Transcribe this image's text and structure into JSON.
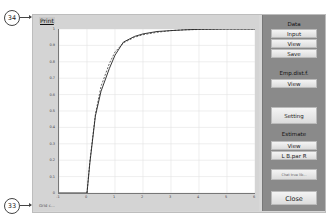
{
  "callouts": [
    {
      "label": "34",
      "target": "print-link"
    },
    {
      "label": "33",
      "target": "grid-link"
    }
  ],
  "plot": {
    "print_label": "Print",
    "bottom_label": "Grid c..."
  },
  "side_panel": {
    "data_group": {
      "label": "Data",
      "buttons": [
        "Input",
        "View",
        "Save"
      ]
    },
    "emp_group": {
      "label": "Emp.dist.f.",
      "buttons": [
        "View"
      ]
    },
    "setting_button": "Setting",
    "estimate_group": {
      "label": "Estimate",
      "buttons": [
        "View",
        "L B.par R"
      ]
    },
    "small_button": "Chat true lib...",
    "close_button": "Close"
  },
  "chart_data": {
    "type": "line",
    "title": "",
    "xlabel": "",
    "ylabel": "",
    "xlim": [
      -1,
      6
    ],
    "ylim": [
      0,
      1
    ],
    "grid": true,
    "x_ticks": [
      "-1",
      "0",
      "1",
      "2",
      "3",
      "4",
      "5",
      "6"
    ],
    "y_ticks": [
      "0",
      "0.1",
      "0.2",
      "0.3",
      "0.4",
      "0.5",
      "0.6",
      "0.7",
      "0.8",
      "0.9",
      "1"
    ],
    "series": [
      {
        "name": "empirical distribution",
        "style": "solid",
        "color": "#222222",
        "x": [
          -1,
          0,
          0.1,
          0.3,
          0.5,
          0.8,
          1.0,
          1.3,
          1.7,
          2.0,
          2.5,
          3.0,
          3.5,
          4.0,
          4.5,
          5.0,
          5.5,
          6.0
        ],
        "y": [
          0,
          0,
          0.18,
          0.47,
          0.62,
          0.76,
          0.84,
          0.92,
          0.955,
          0.97,
          0.985,
          0.99,
          0.995,
          0.998,
          0.999,
          1.0,
          1.0,
          1.0
        ]
      },
      {
        "name": "estimated distribution",
        "style": "dashed",
        "color": "#222222",
        "x": [
          0,
          0.1,
          0.3,
          0.5,
          0.8,
          1.0,
          1.3,
          1.7,
          2.0,
          2.5,
          3.0,
          3.5,
          4.0,
          4.5,
          5.0,
          5.5,
          6.0
        ],
        "y": [
          0,
          0.19,
          0.48,
          0.65,
          0.79,
          0.86,
          0.915,
          0.95,
          0.965,
          0.98,
          0.99,
          0.995,
          0.997,
          0.999,
          1.0,
          1.0,
          1.0
        ]
      }
    ]
  }
}
